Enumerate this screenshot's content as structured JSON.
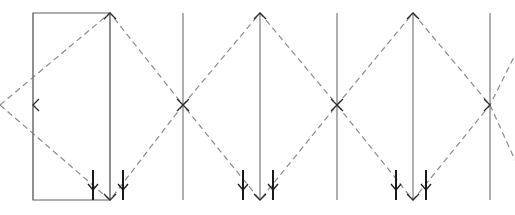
{
  "canvas": {
    "width": 515,
    "height": 215,
    "background": "#ffffff",
    "title": "Truss lattice force diagram"
  },
  "style": {
    "solid_color": "#7a7a7a",
    "dashed_color": "#8a8a8a",
    "arrow_color": "#2b2b2b",
    "tick_color": "#1a1a1a",
    "solid_width": 1.2,
    "dashed_width": 1.2,
    "dash_pattern": "6,4"
  },
  "geometry": {
    "top_y": 13,
    "bottom_y": 200,
    "mid_y": 105,
    "node_x": [
      33,
      110,
      183,
      260,
      337,
      413,
      490
    ]
  },
  "rectangle": {
    "label": "left-panel-rectangle",
    "x": 33,
    "y": 13,
    "width": 77,
    "height": 187,
    "stroke": "#7a7a7a",
    "fill": "none"
  },
  "verticals": [
    {
      "name": "vertical-line-1",
      "x": 33,
      "arrow_top": false,
      "arrow_bottom": false
    },
    {
      "name": "vertical-line-2",
      "x": 110,
      "arrow_top": false,
      "arrow_bottom": false
    },
    {
      "name": "vertical-line-3",
      "x": 183,
      "arrow_top": false,
      "arrow_bottom": false
    },
    {
      "name": "vertical-line-4",
      "x": 260,
      "arrow_top": true,
      "arrow_bottom": true
    },
    {
      "name": "vertical-line-5",
      "x": 337,
      "arrow_top": false,
      "arrow_bottom": false
    },
    {
      "name": "vertical-line-6",
      "x": 413,
      "arrow_top": true,
      "arrow_bottom": true
    },
    {
      "name": "vertical-line-7",
      "x": 490,
      "arrow_top": false,
      "arrow_bottom": false
    }
  ],
  "zigzag": {
    "name": "dashed-zigzag-lattice",
    "upper_points": "0,105 110,13 183,105 260,13 337,105 413,13 490,105 515,160",
    "lower_points": "0,105 110,200 183,105 260,200 337,105 413,200 490,105 515,55"
  },
  "vertex_arrows": [
    {
      "name": "arrowhead-left-mid",
      "x": 33,
      "y": 105,
      "direction": "left"
    },
    {
      "name": "arrowhead-top-apex-1",
      "x": 110,
      "y": 13,
      "direction": "up"
    },
    {
      "name": "arrowhead-bottom-apex-1",
      "x": 110,
      "y": 200,
      "direction": "down"
    },
    {
      "name": "arrowhead-cross-1",
      "x": 183,
      "y": 105,
      "direction": "cross"
    },
    {
      "name": "arrowhead-top-apex-2",
      "x": 260,
      "y": 13,
      "direction": "up"
    },
    {
      "name": "arrowhead-bottom-apex-2",
      "x": 260,
      "y": 200,
      "direction": "down"
    },
    {
      "name": "arrowhead-cross-2",
      "x": 337,
      "y": 105,
      "direction": "cross"
    },
    {
      "name": "arrowhead-top-apex-3",
      "x": 413,
      "y": 13,
      "direction": "up"
    },
    {
      "name": "arrowhead-bottom-apex-3",
      "x": 413,
      "y": 200,
      "direction": "down"
    },
    {
      "name": "arrowhead-right-mid",
      "x": 490,
      "y": 105,
      "direction": "right"
    }
  ],
  "load_ticks": [
    {
      "name": "load-tick-1",
      "x": 93,
      "y_top": 170,
      "y_bottom": 200
    },
    {
      "name": "load-tick-2",
      "x": 123,
      "y_top": 170,
      "y_bottom": 200
    },
    {
      "name": "load-tick-3",
      "x": 243,
      "y_top": 170,
      "y_bottom": 200
    },
    {
      "name": "load-tick-4",
      "x": 273,
      "y_top": 170,
      "y_bottom": 200
    },
    {
      "name": "load-tick-5",
      "x": 396,
      "y_top": 170,
      "y_bottom": 200
    },
    {
      "name": "load-tick-6",
      "x": 426,
      "y_top": 170,
      "y_bottom": 200
    }
  ]
}
